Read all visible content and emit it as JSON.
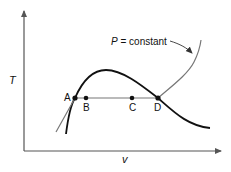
{
  "diagram": {
    "axes": {
      "y_label": "T",
      "x_label": "v"
    },
    "curve_label": {
      "symbol": "P",
      "text": " = constant"
    },
    "points": [
      {
        "id": "A",
        "label": "A"
      },
      {
        "id": "B",
        "label": "B"
      },
      {
        "id": "C",
        "label": "C"
      },
      {
        "id": "D",
        "label": "D"
      }
    ],
    "colors": {
      "dome": "#111111",
      "isobar": "#777777",
      "axes": "#555555"
    }
  }
}
